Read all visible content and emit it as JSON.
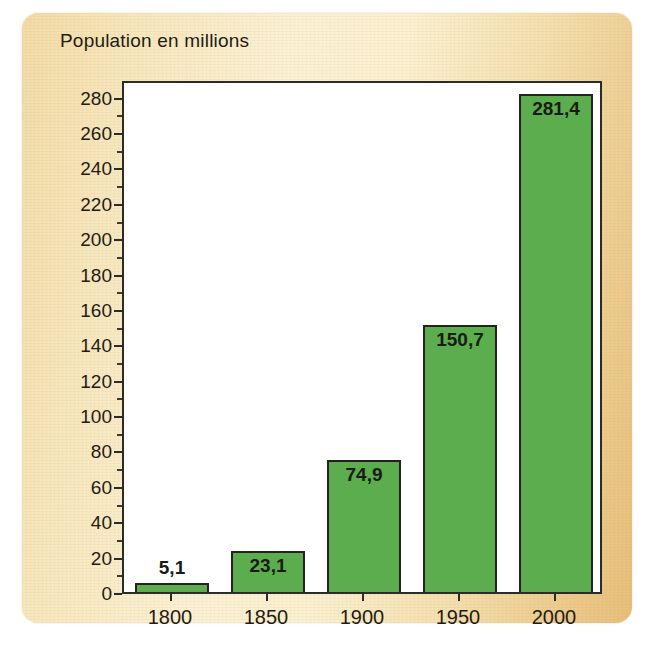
{
  "figure": {
    "title": "Population en millions",
    "panel_color_left": "#f3dba6",
    "panel_color_right": "#e7bf79",
    "plot_background": "#ffffff",
    "bar_color": "#5cad4e",
    "bar_border_color": "#23221f",
    "axis_color": "#2b2b28",
    "text_color": "#241c13"
  },
  "chart_data": {
    "type": "bar",
    "title": "Population en millions",
    "xlabel": "",
    "ylabel": "",
    "categories": [
      "1800",
      "1850",
      "1900",
      "1950",
      "2000"
    ],
    "values": [
      5.1,
      23.1,
      74.9,
      150.7,
      281.4
    ],
    "value_labels": [
      "5,1",
      "23,1",
      "74,9",
      "150,7",
      "281,4"
    ],
    "ylim": [
      0,
      290
    ],
    "ytick_step": 20,
    "yminor_step": 10,
    "yticks": [
      0,
      20,
      40,
      60,
      80,
      100,
      120,
      140,
      160,
      180,
      200,
      220,
      240,
      260,
      280
    ],
    "ytick_labels": [
      "0",
      "20",
      "40",
      "60",
      "80",
      "100",
      "120",
      "140",
      "160",
      "180",
      "200",
      "220",
      "240",
      "260",
      "280"
    ],
    "grid": false,
    "legend": false,
    "legend_position": "none",
    "label_placement": [
      "outside",
      "inside",
      "inside",
      "inside",
      "inside"
    ]
  }
}
